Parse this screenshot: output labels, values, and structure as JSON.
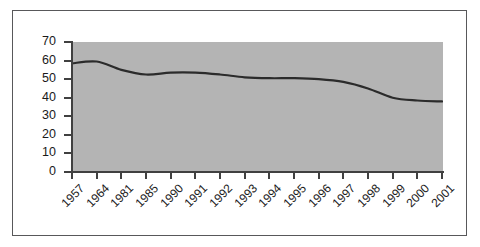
{
  "chart_data": {
    "type": "line",
    "title": "",
    "subtitle": "",
    "xlabel": "",
    "ylabel": "",
    "categories": [
      "1957",
      "1964",
      "1981",
      "1985",
      "1990",
      "1991",
      "1992",
      "1993",
      "1994",
      "1995",
      "1996",
      "1997",
      "1998",
      "1999",
      "2000",
      "2001"
    ],
    "values": [
      58.5,
      59.5,
      55,
      52.5,
      53.5,
      53.5,
      52.5,
      51,
      50.5,
      50.5,
      50,
      48.5,
      45,
      40,
      38.5,
      38
    ],
    "series": [
      {
        "name": "",
        "values": [
          58.5,
          59.5,
          55,
          52.5,
          53.5,
          53.5,
          52.5,
          51,
          50.5,
          50.5,
          50,
          48.5,
          45,
          40,
          38.5,
          38
        ]
      }
    ],
    "ylim": [
      0,
      70
    ],
    "ytick_values": [
      0,
      10,
      20,
      30,
      40,
      50,
      60,
      70
    ],
    "ytick_labels": [
      "0",
      "10",
      "20",
      "30",
      "40",
      "50",
      "60",
      "70"
    ],
    "grid": false,
    "legend": false,
    "legend_position": "none",
    "line_color": "#2b2b2b",
    "plot_background_color": "#b4b4b4",
    "figure_background_color": "#ffffff",
    "axis_color": "#404040",
    "frame_color": "#58585a",
    "annotations": []
  }
}
